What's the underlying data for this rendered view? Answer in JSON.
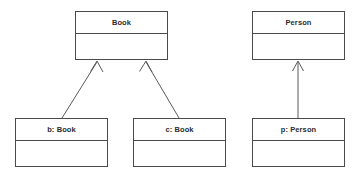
{
  "diagram": {
    "type": "uml-object-diagram",
    "canvas": {
      "width": 361,
      "height": 175,
      "background": "#ffffff"
    },
    "style": {
      "border_color": "#4a4a4a",
      "fill_color": "#ffffff",
      "text_color": "#2b2b2b",
      "line_color": "#5a5a5a",
      "arrow_head": "open-v"
    },
    "nodes": [
      {
        "id": "book-class",
        "label": "Book",
        "kind": "class",
        "x": 75,
        "y": 11,
        "width": 93,
        "height": 49
      },
      {
        "id": "person-class",
        "label": "Person",
        "kind": "class",
        "x": 252,
        "y": 11,
        "width": 93,
        "height": 49
      },
      {
        "id": "b-book-object",
        "label": "b: Book",
        "kind": "object",
        "x": 15,
        "y": 118,
        "width": 93,
        "height": 49
      },
      {
        "id": "c-book-object",
        "label": "c: Book",
        "kind": "object",
        "x": 133,
        "y": 118,
        "width": 93,
        "height": 49
      },
      {
        "id": "p-person-object",
        "label": "p: Person",
        "kind": "object",
        "x": 252,
        "y": 118,
        "width": 93,
        "height": 49
      }
    ],
    "edges": [
      {
        "id": "edge-b-to-book",
        "from": "b-book-object",
        "to": "book-class",
        "relation": "instance-of",
        "x1": 62,
        "y1": 118,
        "x2": 97,
        "y2": 61
      },
      {
        "id": "edge-c-to-book",
        "from": "c-book-object",
        "to": "book-class",
        "relation": "instance-of",
        "x1": 179,
        "y1": 118,
        "x2": 146,
        "y2": 61
      },
      {
        "id": "edge-p-to-person",
        "from": "p-person-object",
        "to": "person-class",
        "relation": "instance-of",
        "x1": 298,
        "y1": 118,
        "x2": 298,
        "y2": 61
      }
    ]
  }
}
